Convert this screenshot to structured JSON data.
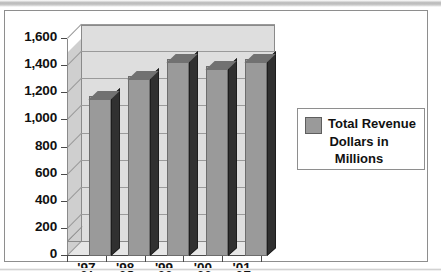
{
  "chart_data": {
    "type": "bar",
    "title": "",
    "xlabel": "",
    "ylabel": "",
    "categories": [
      "'97",
      "'98",
      "'99",
      "'00",
      "'01"
    ],
    "series": [
      {
        "name": "Total Revenue Dollars in Millions",
        "values": [
          1180,
          1330,
          1450,
          1400,
          1450
        ]
      }
    ],
    "ylim": [
      0,
      1600
    ],
    "ytick_labels": [
      "0",
      "200",
      "400",
      "600",
      "800",
      "1,000",
      "1,200",
      "1,400",
      "1,600"
    ],
    "ytick_values": [
      0,
      200,
      400,
      600,
      800,
      1000,
      1200,
      1400,
      1600
    ],
    "grid": true,
    "three_d": true,
    "legend": {
      "position": "right",
      "entries": [
        {
          "label_line1": "Total Revenue",
          "label_line2": "Dollars in",
          "label_line3": "Millions",
          "color": "#9a9a9a"
        }
      ]
    },
    "colors": {
      "bar_face": "#9a9a9a",
      "bar_side": "#303030",
      "bar_top": "#717171",
      "plot_background": "#dedede",
      "frame": "#8e8e8e"
    }
  }
}
